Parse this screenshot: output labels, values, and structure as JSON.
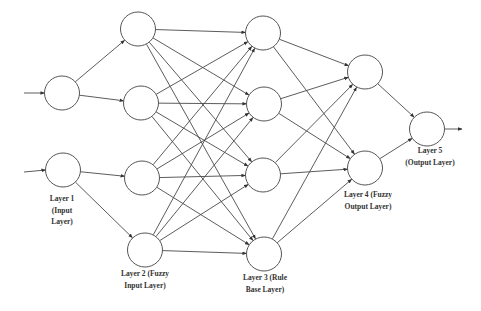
{
  "diagram": {
    "type": "neural-fuzzy network",
    "colors": {
      "node_stroke": "#555555",
      "edge": "#4a4a4a",
      "text": "#333333",
      "background": "#ffffff"
    },
    "layers": [
      {
        "id": "L1",
        "label_lines": [
          "Layer 1",
          "(Input",
          "Layer)"
        ],
        "label_pos": [
          62,
          201
        ],
        "nodes": [
          [
            62,
            93
          ],
          [
            63,
            170
          ]
        ]
      },
      {
        "id": "L2",
        "label_lines": [
          "Layer 2 (Fuzzy",
          "Input Layer)"
        ],
        "label_pos": [
          145,
          276
        ],
        "nodes": [
          [
            138,
            29
          ],
          [
            141,
            103
          ],
          [
            142,
            178
          ],
          [
            145,
            250
          ]
        ]
      },
      {
        "id": "L3",
        "label_lines": [
          "Layer 3 (Rule",
          "Base Layer)"
        ],
        "label_pos": [
          265,
          280
        ],
        "nodes": [
          [
            263,
            33
          ],
          [
            264,
            104
          ],
          [
            263,
            175
          ],
          [
            264,
            254
          ]
        ]
      },
      {
        "id": "L4",
        "label_lines": [
          "Layer 4 (Fuzzy",
          "Output Layer)"
        ],
        "label_pos": [
          368,
          197
        ],
        "nodes": [
          [
            365,
            72
          ],
          [
            365,
            168
          ]
        ]
      },
      {
        "id": "L5",
        "label_lines": [
          "Layer 5",
          "(Output Layer)"
        ],
        "label_pos": [
          430,
          153
        ],
        "nodes": [
          [
            427,
            129
          ]
        ]
      }
    ],
    "node_radius": 17.5,
    "inputs": [
      [
        24,
        93
      ],
      [
        24,
        172
      ]
    ],
    "output": [
      462,
      129
    ],
    "connections": {
      "L1_L2": [
        [
          0,
          0
        ],
        [
          0,
          1
        ],
        [
          1,
          2
        ],
        [
          1,
          3
        ]
      ],
      "L2_L3": "full",
      "L3_L4": "full",
      "L4_L5": "full"
    }
  }
}
